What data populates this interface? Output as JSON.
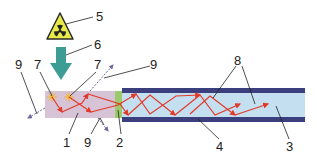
{
  "diagram": {
    "type": "scintillation-fiber-schematic",
    "colors": {
      "scintillator": "#d7c3d6",
      "coupler": "#9cc96b",
      "core": "#c4dff0",
      "cladding": "#3c3f7d",
      "arrow_source": "#3d9c94",
      "photon": "#e23a2a",
      "escape": "#6d6a9e",
      "hazard_fill": "#e8ea4a",
      "leader": "#222222"
    },
    "labels": {
      "l1": "1",
      "l2": "2",
      "l3": "3",
      "l4": "4",
      "l5": "5",
      "l6": "6",
      "l7a": "7",
      "l7b": "7",
      "l8": "8",
      "l9a": "9",
      "l9b": "9",
      "l9c": "9"
    },
    "parts": [
      {
        "number": "1",
        "element": "scintillator-block"
      },
      {
        "number": "2",
        "element": "optical-coupler"
      },
      {
        "number": "3",
        "element": "fiber-core"
      },
      {
        "number": "4",
        "element": "fiber-cladding"
      },
      {
        "number": "5",
        "element": "radiation-source-icon"
      },
      {
        "number": "6",
        "element": "incident-radiation-arrow"
      },
      {
        "number": "7",
        "element": "scintillation-events"
      },
      {
        "number": "8",
        "element": "guided-photon-paths"
      },
      {
        "number": "9",
        "element": "escaping-photons"
      }
    ]
  }
}
